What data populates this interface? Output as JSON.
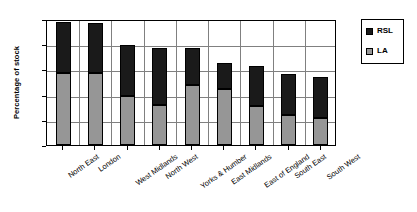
{
  "chart_data": {
    "type": "bar",
    "subtype": "stacked-vertical",
    "title": "",
    "xlabel": "",
    "ylabel": "Percentage of stock",
    "ylim": [
      0,
      25
    ],
    "yticks": [
      0,
      5,
      10,
      15,
      20,
      25
    ],
    "ytick_labels": [
      "0",
      "5",
      "10",
      "15",
      "20",
      "25"
    ],
    "grid": true,
    "grid_axis": "y",
    "legend_position": "right-top",
    "categories": [
      "North East",
      "London",
      "West Midlands",
      "North West",
      "Yorks & Humber",
      "East Midlands",
      "East of England",
      "South East",
      "South West"
    ],
    "series": [
      {
        "name": "LA",
        "color": "#969696",
        "values": [
          14.3,
          14.3,
          9.7,
          8.0,
          11.9,
          11.2,
          7.8,
          5.9,
          5.3
        ]
      },
      {
        "name": "RSL",
        "color": "#1a1a1a",
        "values": [
          10.1,
          9.9,
          10.1,
          11.3,
          7.4,
          5.1,
          7.8,
          8.2,
          8.2
        ]
      }
    ],
    "totals": [
      24.4,
      24.2,
      19.8,
      19.3,
      19.3,
      16.3,
      15.6,
      14.1,
      13.5
    ]
  },
  "legend": {
    "entries": [
      {
        "label": "RSL",
        "color": "#1a1a1a"
      },
      {
        "label": "LA",
        "color": "#969696"
      }
    ]
  },
  "axis": {
    "y_title": "Percentage of stock"
  }
}
